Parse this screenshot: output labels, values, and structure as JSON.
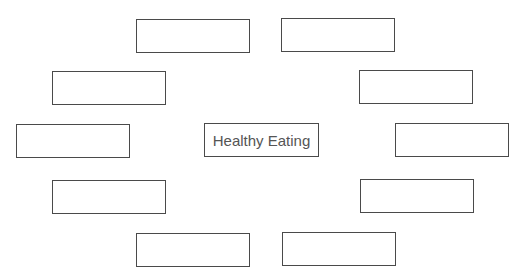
{
  "diagram": {
    "type": "spider-map",
    "center": {
      "label": "Healthy Eating"
    },
    "branches": [
      {
        "position": "top-left",
        "label": ""
      },
      {
        "position": "top-right",
        "label": ""
      },
      {
        "position": "upper-left",
        "label": ""
      },
      {
        "position": "upper-right",
        "label": ""
      },
      {
        "position": "left",
        "label": ""
      },
      {
        "position": "right",
        "label": ""
      },
      {
        "position": "lower-left",
        "label": ""
      },
      {
        "position": "lower-right",
        "label": ""
      },
      {
        "position": "bottom-left",
        "label": ""
      },
      {
        "position": "bottom-right",
        "label": ""
      }
    ]
  }
}
